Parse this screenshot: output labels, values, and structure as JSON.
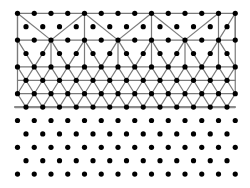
{
  "diagram": {
    "title": "",
    "colors": {
      "background": "#ffffff",
      "node": "#000000",
      "edge": "#7a7a7a"
    },
    "lattice": {
      "rows": 13,
      "y0": 13.3,
      "dy": 13.4,
      "even_row": {
        "x0": 17.5,
        "dx": 16.75,
        "count": 14
      },
      "odd_row": {
        "x0": 26.0,
        "dx": 16.75,
        "count": 13
      },
      "node_radius": 2.6
    },
    "mesh": {
      "horizontal_rows": [
        0,
        2,
        4,
        5,
        6
      ],
      "bottom_line": {
        "row": 7,
        "x_start": 15,
        "x_end": 235
      },
      "left_edge": {
        "k": 0,
        "row_from": 0,
        "row_to": 6
      },
      "right_edge": {
        "k": 13,
        "row_from": 0,
        "row_to": 6
      },
      "top_band_verticals": [
        0,
        4,
        8,
        12,
        13
      ],
      "top_band_diagonals": [
        [
          0,
          0,
          2,
          2
        ],
        [
          4,
          0,
          2,
          2
        ],
        [
          4,
          0,
          6,
          2
        ],
        [
          8,
          0,
          6,
          2
        ],
        [
          8,
          0,
          10,
          2
        ],
        [
          12,
          0,
          10,
          2
        ],
        [
          12,
          2,
          13,
          0
        ]
      ],
      "middle_band_fan_nodes": [
        0,
        2,
        4,
        6,
        8,
        10,
        12
      ],
      "dense_band_rows": [
        4,
        5,
        6,
        7
      ]
    }
  }
}
